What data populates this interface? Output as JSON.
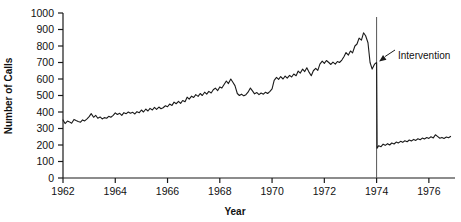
{
  "chart_data": {
    "type": "line",
    "title": "",
    "xlabel": "Year",
    "ylabel": "Number of Calls",
    "xlim": [
      1962.0,
      1977.0
    ],
    "ylim": [
      0,
      1000
    ],
    "grid": false,
    "legend": null,
    "xticks": [
      1962,
      1964,
      1966,
      1968,
      1970,
      1972,
      1974,
      1976
    ],
    "xtick_labels": [
      "1962",
      "1964",
      "1966",
      "1968",
      "1970",
      "1972",
      "1974",
      "1976"
    ],
    "yticks": [
      0,
      100,
      200,
      300,
      400,
      500,
      600,
      700,
      800,
      900,
      1000
    ],
    "ytick_labels": [
      "0",
      "100",
      "200",
      "300",
      "400",
      "500",
      "600",
      "700",
      "800",
      "900",
      "1000"
    ],
    "annotations": [
      {
        "text": "Intervention",
        "kind": "arrow-label",
        "points_to_x": 1974.0,
        "points_to_y": 700
      }
    ],
    "vlines": [
      {
        "x": 1974.0,
        "label": "intervention-line",
        "color": "#555555"
      }
    ],
    "series": [
      {
        "name": "Number of Calls",
        "color": "#1a1a1a",
        "x": [
          1962.0,
          1962.08,
          1962.17,
          1962.25,
          1962.33,
          1962.42,
          1962.5,
          1962.58,
          1962.67,
          1962.75,
          1962.83,
          1962.92,
          1963.0,
          1963.08,
          1963.17,
          1963.25,
          1963.33,
          1963.42,
          1963.5,
          1963.58,
          1963.67,
          1963.75,
          1963.83,
          1963.92,
          1964.0,
          1964.08,
          1964.17,
          1964.25,
          1964.33,
          1964.42,
          1964.5,
          1964.58,
          1964.67,
          1964.75,
          1964.83,
          1964.92,
          1965.0,
          1965.08,
          1965.17,
          1965.25,
          1965.33,
          1965.42,
          1965.5,
          1965.58,
          1965.67,
          1965.75,
          1965.83,
          1965.92,
          1966.0,
          1966.08,
          1966.17,
          1966.25,
          1966.33,
          1966.42,
          1966.5,
          1966.58,
          1966.67,
          1966.75,
          1966.83,
          1966.92,
          1967.0,
          1967.08,
          1967.17,
          1967.25,
          1967.33,
          1967.42,
          1967.5,
          1967.58,
          1967.67,
          1967.75,
          1967.83,
          1967.92,
          1968.0,
          1968.08,
          1968.17,
          1968.25,
          1968.33,
          1968.42,
          1968.5,
          1968.58,
          1968.67,
          1968.75,
          1968.83,
          1968.92,
          1969.0,
          1969.08,
          1969.17,
          1969.25,
          1969.33,
          1969.42,
          1969.5,
          1969.58,
          1969.67,
          1969.75,
          1969.83,
          1969.92,
          1970.0,
          1970.08,
          1970.17,
          1970.25,
          1970.33,
          1970.42,
          1970.5,
          1970.58,
          1970.67,
          1970.75,
          1970.83,
          1970.92,
          1971.0,
          1971.08,
          1971.17,
          1971.25,
          1971.33,
          1971.42,
          1971.5,
          1971.58,
          1971.67,
          1971.75,
          1971.83,
          1971.92,
          1972.0,
          1972.08,
          1972.17,
          1972.25,
          1972.33,
          1972.42,
          1972.5,
          1972.58,
          1972.67,
          1972.75,
          1972.83,
          1972.92,
          1973.0,
          1973.08,
          1973.17,
          1973.25,
          1973.33,
          1973.42,
          1973.5,
          1973.58,
          1973.67,
          1973.75,
          1973.83,
          1973.92,
          1974.0,
          1974.02,
          1974.08,
          1974.17,
          1974.25,
          1974.33,
          1974.42,
          1974.5,
          1974.58,
          1974.67,
          1974.75,
          1974.83,
          1974.92,
          1975.0,
          1975.08,
          1975.17,
          1975.25,
          1975.33,
          1975.42,
          1975.5,
          1975.58,
          1975.67,
          1975.75,
          1975.83,
          1975.92,
          1976.0,
          1976.08,
          1976.17,
          1976.25,
          1976.33,
          1976.42,
          1976.5,
          1976.58,
          1976.67,
          1976.75,
          1976.83
        ],
        "y": [
          352,
          330,
          345,
          340,
          332,
          355,
          348,
          342,
          338,
          352,
          346,
          358,
          372,
          390,
          368,
          380,
          362,
          370,
          358,
          366,
          362,
          374,
          368,
          380,
          395,
          385,
          392,
          380,
          396,
          390,
          400,
          392,
          398,
          388,
          402,
          396,
          412,
          400,
          418,
          406,
          422,
          412,
          428,
          416,
          430,
          420,
          426,
          438,
          432,
          448,
          440,
          460,
          450,
          465,
          452,
          470,
          462,
          490,
          478,
          496,
          488,
          505,
          495,
          512,
          500,
          520,
          508,
          525,
          515,
          535,
          545,
          530,
          552,
          545,
          568,
          588,
          572,
          600,
          580,
          560,
          512,
          500,
          508,
          498,
          505,
          520,
          545,
          528,
          510,
          518,
          505,
          515,
          508,
          520,
          512,
          525,
          540,
          592,
          610,
          598,
          615,
          600,
          618,
          605,
          622,
          612,
          630,
          620,
          648,
          636,
          660,
          645,
          668,
          640,
          620,
          650,
          665,
          652,
          690,
          708,
          695,
          712,
          700,
          688,
          702,
          690,
          706,
          700,
          715,
          735,
          760,
          745,
          770,
          758,
          800,
          812,
          848,
          836,
          880,
          862,
          820,
          700,
          660,
          690,
          700,
          180,
          196,
          190,
          205,
          198,
          208,
          200,
          212,
          206,
          218,
          212,
          222,
          216,
          226,
          220,
          230,
          224,
          234,
          228,
          238,
          232,
          242,
          236,
          245,
          240,
          250,
          243,
          262,
          252,
          241,
          246,
          240,
          248,
          244,
          252
        ]
      }
    ]
  },
  "axes": {
    "ylabel_text": "Number of Calls",
    "xlabel_text": "Year"
  },
  "annotation": {
    "intervention_text": "Intervention"
  }
}
